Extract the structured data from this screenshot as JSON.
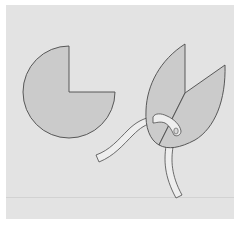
{
  "figure": {
    "caption": "",
    "background_color": "#e3e3e3",
    "shape_fill": "#cbcbcb",
    "stroke_color": "#4a4a4a",
    "cord_fill": "#eeeeee",
    "elements": [
      {
        "id": "circle-with-quarter-cut",
        "label": "Circle with one quarter removed"
      },
      {
        "id": "folded-cone-leaves",
        "label": "Circle folded into two overlapping leaf-shaped flaps"
      },
      {
        "id": "cord",
        "label": "Cord threaded through a hole in the folded flaps"
      }
    ]
  }
}
